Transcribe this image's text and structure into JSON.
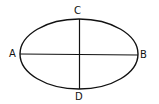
{
  "diagram": {
    "shape": "ellipse",
    "labels": {
      "top": "C",
      "left": "A",
      "right": "B",
      "bottom": "D"
    },
    "lines": [
      "AB (major axis)",
      "CD (minor axis)"
    ],
    "stroke_color": "#111111"
  }
}
